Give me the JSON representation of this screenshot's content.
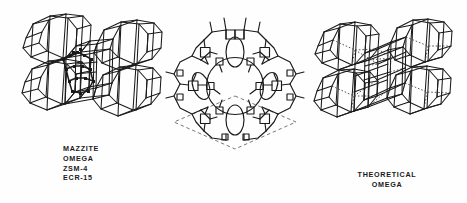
{
  "figure": {
    "background_color": "#fefefe",
    "line_color": "#1a1a1a",
    "hidden_line_style": "dotted"
  },
  "panels": {
    "left": {
      "name": "mazzite-framework-3d",
      "description": "Three-dimensional cage cluster framework drawing",
      "caption_lines": [
        "MAZZITE",
        "OMEGA",
        "ZSM-4",
        "ECR-15"
      ]
    },
    "center": {
      "name": "channel-projection-2d",
      "description": "Two-dimensional projection of 12-ring main channel with dashed unit cell outline",
      "caption_lines": []
    },
    "right": {
      "name": "theoretical-omega-framework-3d",
      "description": "Three-dimensional cage cluster framework drawing with dotted hidden edges",
      "caption_lines": [
        "THEORETICAL",
        "OMEGA"
      ]
    }
  },
  "captions": {
    "left_line_1": "MAZZITE",
    "left_line_2": "OMEGA",
    "left_line_3": "ZSM-4",
    "left_line_4": "ECR-15",
    "right_line_1": "THEORETICAL",
    "right_line_2": "OMEGA"
  }
}
